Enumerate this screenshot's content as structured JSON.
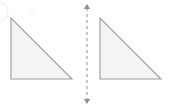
{
  "figure": {
    "background_color": "#ffffff",
    "width": 169,
    "height": 108
  },
  "style": {
    "shape_fill": "#f4f4f4",
    "shape_stroke": "#9b9b9b",
    "axis_color": "#8f8f8f",
    "artifact_color": "#efefef"
  },
  "shapes": [
    {
      "name": "left-triangle",
      "kind": "right-triangle",
      "right_angle_vertex": "bottom-left",
      "label": "",
      "points": "11,18 11,79 72,79",
      "vertices": [
        {
          "name": "apex",
          "x": 11,
          "y": 18
        },
        {
          "name": "right-angle",
          "x": 11,
          "y": 79
        },
        {
          "name": "base-end",
          "x": 72,
          "y": 79
        }
      ],
      "leg_vertical_px": 61,
      "leg_horizontal_px": 61
    },
    {
      "name": "right-triangle",
      "kind": "right-triangle",
      "right_angle_vertex": "bottom-left",
      "label": "",
      "points": "100,18 100,79 161,79",
      "vertices": [
        {
          "name": "apex",
          "x": 100,
          "y": 18
        },
        {
          "name": "right-angle",
          "x": 100,
          "y": 79
        },
        {
          "name": "base-end",
          "x": 161,
          "y": 79
        }
      ],
      "leg_vertical_px": 61,
      "leg_horizontal_px": 61
    }
  ],
  "axis": {
    "name": "vertical-dashed-axis",
    "orientation": "vertical",
    "x": 87,
    "y_top": 4,
    "y_bottom": 104,
    "dash_pattern": "3 3",
    "arrowheads": [
      "top",
      "bottom"
    ],
    "label": ""
  },
  "artifacts": [
    {
      "name": "corner-arc-artifact",
      "description": "faint partial ellipse arc at top-left edge",
      "cx": 1,
      "cy": 12,
      "rx": 7,
      "ry": 9
    },
    {
      "name": "scan-smudge-artifact",
      "description": "faint light blob above left triangle",
      "cx": 31,
      "cy": 12,
      "r": 4
    }
  ]
}
